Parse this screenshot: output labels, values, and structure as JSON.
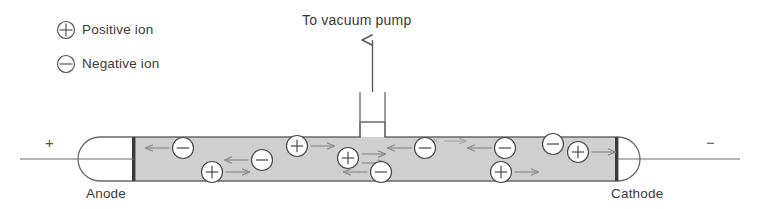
{
  "figure": {
    "title_text": "",
    "colors": {
      "stroke": "#4a4a4a",
      "gas_fill": "#cfcfcf",
      "electrode": "#3a3a3a",
      "text": "#3a3a3a",
      "faint": "#9a9a9a"
    },
    "legend": {
      "items": [
        {
          "symbol": "positive-ion-symbol",
          "glyph": "+",
          "label": "Positive ion"
        },
        {
          "symbol": "negative-ion-symbol",
          "glyph": "−",
          "label": "Negative ion"
        }
      ]
    },
    "vacuum_port": {
      "label": "To vacuum pump",
      "arrow": "up-arrow-icon"
    },
    "terminals": {
      "left_sign": "+",
      "right_sign": "−"
    },
    "electrodes": [
      {
        "name": "anode",
        "label": "Anode",
        "side": "left",
        "polarity": "+"
      },
      {
        "name": "cathode",
        "label": "Cathode",
        "side": "right",
        "polarity": "−"
      }
    ],
    "field_marker": {
      "sign": "+",
      "arrow": "right-arrow-icon",
      "meaning": "electric field direction"
    },
    "ions": [
      {
        "type": "negative",
        "glyph": "−",
        "x": 183,
        "y": 148,
        "arrow": "left",
        "arrow_count": 1
      },
      {
        "type": "positive",
        "glyph": "+",
        "x": 212,
        "y": 172,
        "arrow": "right",
        "arrow_count": 1
      },
      {
        "type": "negative",
        "glyph": "−",
        "x": 262,
        "y": 160,
        "arrow": "left",
        "arrow_count": 1
      },
      {
        "type": "positive",
        "glyph": "+",
        "x": 297,
        "y": 146,
        "arrow": "right",
        "arrow_count": 1
      },
      {
        "type": "positive",
        "glyph": "+",
        "x": 348,
        "y": 158,
        "arrow": "right",
        "arrow_count": 2
      },
      {
        "type": "negative",
        "glyph": "−",
        "x": 381,
        "y": 172,
        "arrow": "left",
        "arrow_count": 1
      },
      {
        "type": "negative",
        "glyph": "−",
        "x": 425,
        "y": 148,
        "arrow": "left",
        "arrow_count": 1
      },
      {
        "type": "negative",
        "glyph": "−",
        "x": 505,
        "y": 148,
        "arrow": "left",
        "arrow_count": 1
      },
      {
        "type": "positive",
        "glyph": "+",
        "x": 501,
        "y": 172,
        "arrow": "right",
        "arrow_count": 1
      },
      {
        "type": "negative",
        "glyph": "−",
        "x": 553,
        "y": 144,
        "arrow": "none",
        "arrow_count": 0
      },
      {
        "type": "positive",
        "glyph": "+",
        "x": 578,
        "y": 152,
        "arrow": "right",
        "arrow_count": 1
      }
    ]
  }
}
